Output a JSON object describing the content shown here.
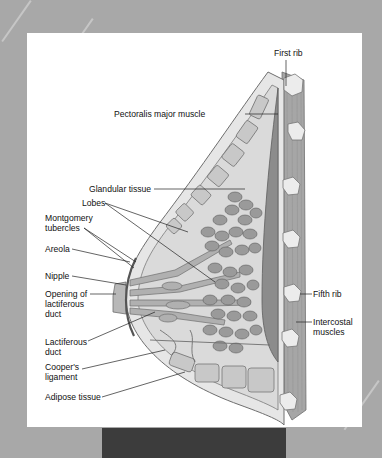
{
  "figure": {
    "type": "anatomical cross-section",
    "colors": {
      "background": "#a8a8a8",
      "panel": "#ffffff",
      "footer_bar": "#3c3c3c",
      "tissue_fill": "#d6d6d6",
      "lobule_fill": "#9a9a9a",
      "muscle_fill": "#8c8c8c",
      "outline": "#6e6e6e",
      "rib_fill": "#e8e8e8"
    }
  },
  "labels": {
    "first_rib": "First rib",
    "pectoralis": "Pectoralis major muscle",
    "glandular": "Glandular tissue",
    "lobes": "Lobes",
    "montgomery_1": "Montgomery",
    "montgomery_2": "tubercles",
    "areola": "Areola",
    "nipple": "Nipple",
    "opening_1": "Opening of",
    "opening_2": "lactiferous",
    "opening_3": "duct",
    "lactiferous_1": "Lactiferous",
    "lactiferous_2": "duct",
    "coopers_1": "Cooper's",
    "coopers_2": "ligament",
    "adipose": "Adipose tissue",
    "fifth_rib": "Fifth rib",
    "intercostal_1": "Intercostal",
    "intercostal_2": "muscles"
  }
}
